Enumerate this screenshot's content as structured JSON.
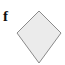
{
  "figure": {
    "label": "f",
    "shape": {
      "type": "kite",
      "fill": "#ebebeb",
      "stroke": "#8a8a8a",
      "points": "39,11 61,33 39,63 17,33"
    }
  }
}
